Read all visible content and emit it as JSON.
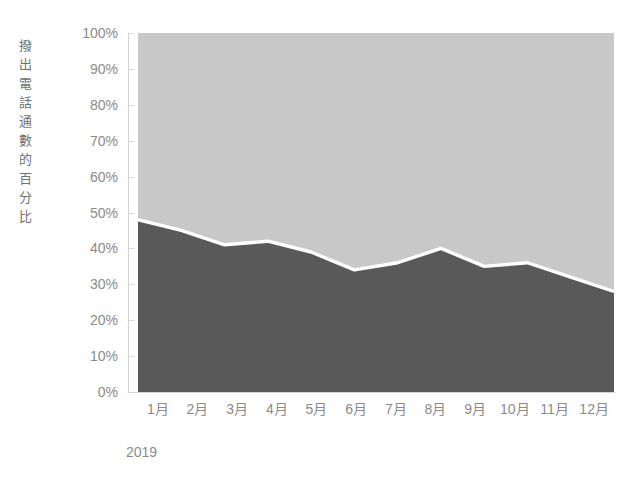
{
  "chart_data": {
    "type": "area",
    "title": "",
    "subtitle": "",
    "xlabel": "2019",
    "ylabel": "撥出電話通數的百分比",
    "categories": [
      "1月",
      "2月",
      "3月",
      "4月",
      "5月",
      "6月",
      "7月",
      "8月",
      "9月",
      "10月",
      "11月",
      "12月"
    ],
    "ylim": [
      0,
      100
    ],
    "ytick_labels": [
      "0%",
      "10%",
      "20%",
      "30%",
      "40%",
      "50%",
      "60%",
      "70%",
      "80%",
      "90%",
      "100%"
    ],
    "ytick_values": [
      0,
      10,
      20,
      30,
      40,
      50,
      60,
      70,
      80,
      90,
      100
    ],
    "grid": false,
    "legend": "none",
    "stacked": true,
    "series": [
      {
        "name": "lower-series",
        "color": "#595959",
        "values": [
          48,
          45,
          41,
          42,
          39,
          34,
          36,
          40,
          35,
          36,
          32,
          28
        ]
      },
      {
        "name": "upper-series",
        "color": "#c8c8c8",
        "values": [
          52,
          55,
          59,
          58,
          61,
          66,
          64,
          60,
          65,
          64,
          68,
          72
        ]
      }
    ],
    "separator_color": "#ffffff",
    "axis_color": "#d2d2d2",
    "tick_text_color": "#8a8a8a",
    "plot_background": "#ffffff"
  }
}
